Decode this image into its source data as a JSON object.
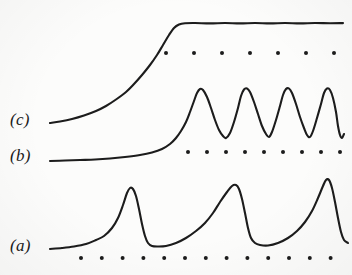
{
  "figure": {
    "kind": "scanned-oscilloscope-figure",
    "background_color": "#fcfcfb",
    "ink_color": "#1c1c1c",
    "width": 352,
    "height": 275,
    "labels": [
      {
        "name": "trace-c",
        "text": "(c)",
        "x": 10,
        "y": 110
      },
      {
        "name": "trace-b",
        "text": "(b)",
        "x": 10,
        "y": 146
      },
      {
        "name": "trace-a",
        "text": "(a)",
        "x": 10,
        "y": 236
      }
    ]
  },
  "chart_data": {
    "type": "line",
    "title": "",
    "subtitle": "",
    "xlabel": "",
    "ylabel": "",
    "xlim": [
      0,
      352
    ],
    "ylim": [
      275,
      0
    ],
    "grid": false,
    "legend_position": "left-inline",
    "axes_visible": false,
    "annotations": [
      "(a)",
      "(b)",
      "(c)"
    ],
    "series": [
      {
        "name": "(c)",
        "label": "(c)",
        "description": "monotonic sigmoid rise from low baseline to flat saturated plateau",
        "stroke": "#1c1c1c",
        "stroke_width": 2.1,
        "points": [
          [
            50,
            123
          ],
          [
            60,
            121.5
          ],
          [
            72,
            119
          ],
          [
            84,
            115.5
          ],
          [
            96,
            111
          ],
          [
            106,
            106
          ],
          [
            116,
            99.5
          ],
          [
            126,
            92
          ],
          [
            134,
            84
          ],
          [
            142,
            75
          ],
          [
            150,
            65
          ],
          [
            157,
            55
          ],
          [
            163,
            45
          ],
          [
            169,
            35
          ],
          [
            174,
            28
          ],
          [
            179,
            24.5
          ],
          [
            185,
            23.2
          ],
          [
            195,
            23.0
          ],
          [
            210,
            23.4
          ],
          [
            225,
            23.0
          ],
          [
            240,
            23.4
          ],
          [
            255,
            23.0
          ],
          [
            270,
            23.4
          ],
          [
            285,
            23.0
          ],
          [
            300,
            23.4
          ],
          [
            315,
            23.0
          ],
          [
            330,
            23.3
          ],
          [
            343,
            23.1
          ]
        ]
      },
      {
        "name": "(b)",
        "label": "(b)",
        "description": "slow exponential rise then four near-sinusoidal oscillations of constant amplitude",
        "stroke": "#1c1c1c",
        "stroke_width": 2.1,
        "points": [
          [
            50,
            161
          ],
          [
            65,
            160.5
          ],
          [
            80,
            160
          ],
          [
            95,
            159.5
          ],
          [
            110,
            158.5
          ],
          [
            125,
            157
          ],
          [
            140,
            155
          ],
          [
            152,
            152.5
          ],
          [
            162,
            149
          ],
          [
            170,
            144
          ],
          [
            176,
            138
          ],
          [
            181,
            131
          ],
          [
            186,
            122
          ],
          [
            190,
            112
          ],
          [
            194,
            101
          ],
          [
            197,
            93
          ],
          [
            200,
            89
          ],
          [
            203,
            90
          ],
          [
            207,
            97
          ],
          [
            211,
            108
          ],
          [
            215,
            120
          ],
          [
            219,
            130
          ],
          [
            223,
            136
          ],
          [
            226,
            138
          ],
          [
            230,
            133
          ],
          [
            234,
            122
          ],
          [
            238,
            108
          ],
          [
            241,
            96
          ],
          [
            244,
            89.5
          ],
          [
            247,
            88.5
          ],
          [
            250,
            92
          ],
          [
            254,
            102
          ],
          [
            258,
            114
          ],
          [
            262,
            126
          ],
          [
            266,
            134
          ],
          [
            269,
            137
          ],
          [
            272,
            132
          ],
          [
            276,
            120
          ],
          [
            280,
            106
          ],
          [
            283,
            95
          ],
          [
            286,
            89
          ],
          [
            289,
            88.5
          ],
          [
            292,
            93
          ],
          [
            296,
            104
          ],
          [
            300,
            117
          ],
          [
            304,
            128
          ],
          [
            307,
            135
          ],
          [
            310,
            137
          ],
          [
            313,
            131
          ],
          [
            317,
            118
          ],
          [
            321,
            104
          ],
          [
            324,
            93
          ],
          [
            327,
            88.5
          ],
          [
            330,
            90
          ],
          [
            333,
            98
          ],
          [
            336,
            112
          ],
          [
            338,
            126
          ],
          [
            340,
            135
          ],
          [
            342,
            138
          ],
          [
            344,
            134
          ]
        ]
      },
      {
        "name": "(a)",
        "label": "(a)",
        "description": "relaxation oscillation: three asymmetric spikes with slow rise and abrupt fall",
        "stroke": "#1c1c1c",
        "stroke_width": 2.1,
        "points": [
          [
            50,
            249
          ],
          [
            62,
            248
          ],
          [
            74,
            246.5
          ],
          [
            86,
            244
          ],
          [
            96,
            240
          ],
          [
            104,
            236
          ],
          [
            112,
            228
          ],
          [
            118,
            218
          ],
          [
            123,
            205
          ],
          [
            127,
            193
          ],
          [
            130,
            188
          ],
          [
            133,
            189
          ],
          [
            136,
            196
          ],
          [
            139,
            209
          ],
          [
            142,
            224
          ],
          [
            145,
            236
          ],
          [
            148,
            243
          ],
          [
            152,
            246
          ],
          [
            158,
            246.5
          ],
          [
            166,
            246
          ],
          [
            176,
            243
          ],
          [
            186,
            238
          ],
          [
            196,
            231
          ],
          [
            205,
            223
          ],
          [
            213,
            213
          ],
          [
            220,
            202
          ],
          [
            227,
            192
          ],
          [
            232,
            186
          ],
          [
            236,
            185
          ],
          [
            239,
            189
          ],
          [
            242,
            199
          ],
          [
            245,
            213
          ],
          [
            248,
            228
          ],
          [
            251,
            238
          ],
          [
            255,
            243
          ],
          [
            260,
            245
          ],
          [
            268,
            245.5
          ],
          [
            278,
            243
          ],
          [
            288,
            238
          ],
          [
            297,
            231
          ],
          [
            305,
            222
          ],
          [
            312,
            211
          ],
          [
            318,
            198
          ],
          [
            323,
            186
          ],
          [
            326,
            180
          ],
          [
            329,
            180
          ],
          [
            332,
            188
          ],
          [
            335,
            202
          ],
          [
            338,
            218
          ],
          [
            341,
            232
          ],
          [
            344,
            240
          ],
          [
            348,
            243
          ]
        ]
      }
    ],
    "marker_rows": [
      {
        "name": "timing-dots-c",
        "belongs_to": "(c)",
        "y": 53,
        "count": 7,
        "x_start": 166,
        "x_spacing": 28,
        "radius": 2.0,
        "color": "#1c1c1c"
      },
      {
        "name": "timing-dots-b",
        "belongs_to": "(b)",
        "y": 152,
        "count": 9,
        "x_start": 188,
        "x_spacing": 19,
        "radius": 2.0,
        "color": "#1c1c1c"
      },
      {
        "name": "timing-dots-a",
        "belongs_to": "(a)",
        "y": 258,
        "count": 13,
        "x_start": 81,
        "x_spacing": 20.8,
        "radius": 2.0,
        "color": "#1c1c1c"
      }
    ]
  }
}
